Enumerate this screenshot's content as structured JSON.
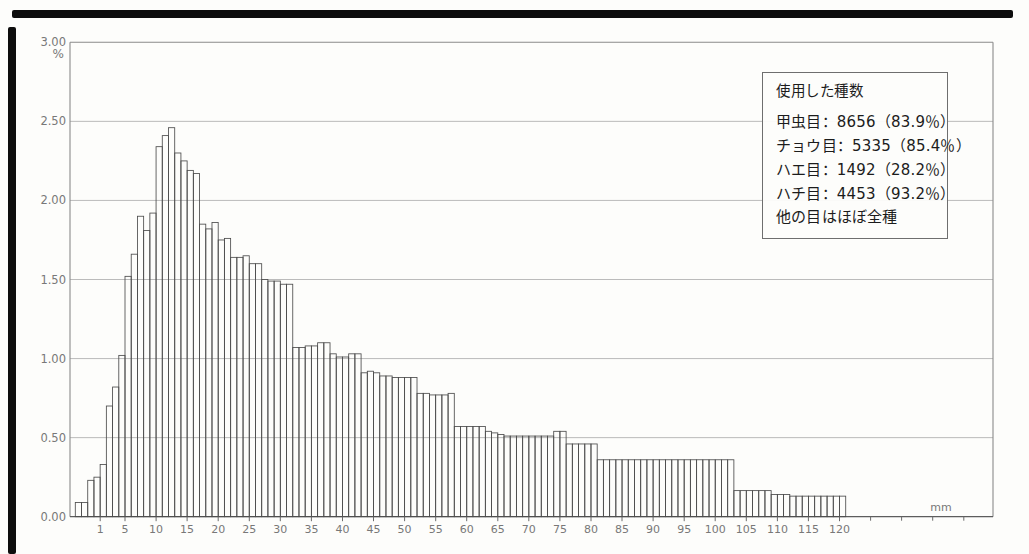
{
  "chart_data": {
    "type": "bar",
    "title": "",
    "xlabel": "mm",
    "ylabel": "%",
    "ylim": [
      0,
      3
    ],
    "grid": "horizontal",
    "y_tick_labels": [
      "3.00",
      "2.50",
      "2.00",
      "1.50",
      "1.00",
      "0.50",
      "0.00"
    ],
    "y_tick_values": [
      3.0,
      2.5,
      2.0,
      1.5,
      1.0,
      0.5,
      0.0
    ],
    "x_tick_labels": [
      1,
      5,
      10,
      15,
      20,
      25,
      30,
      35,
      40,
      45,
      50,
      55,
      60,
      65,
      70,
      75,
      80,
      85,
      90,
      95,
      100,
      105,
      110,
      115,
      120
    ],
    "x_unlabeled_ticks_mm": [
      125,
      130,
      135,
      140
    ],
    "bin_width_mm": 1,
    "bar_fill": "none",
    "bar_outline": "#4d4d4d",
    "values_pct": [
      0.09,
      0.09,
      0.23,
      0.25,
      0.33,
      0.7,
      0.82,
      1.02,
      1.52,
      1.66,
      1.9,
      1.81,
      1.92,
      2.34,
      2.41,
      2.46,
      2.3,
      2.25,
      2.19,
      2.17,
      1.85,
      1.82,
      1.86,
      1.75,
      1.76,
      1.64,
      1.64,
      1.65,
      1.6,
      1.6,
      1.5,
      1.49,
      1.49,
      1.47,
      1.47,
      1.07,
      1.07,
      1.08,
      1.08,
      1.1,
      1.1,
      1.03,
      1.01,
      1.01,
      1.03,
      1.03,
      0.91,
      0.92,
      0.91,
      0.89,
      0.89,
      0.88,
      0.88,
      0.88,
      0.88,
      0.78,
      0.78,
      0.77,
      0.77,
      0.77,
      0.78,
      0.57,
      0.57,
      0.57,
      0.57,
      0.57,
      0.54,
      0.53,
      0.52,
      0.51,
      0.51,
      0.51,
      0.51,
      0.51,
      0.51,
      0.51,
      0.51,
      0.54,
      0.54,
      0.46,
      0.46,
      0.46,
      0.46,
      0.46,
      0.36,
      0.36,
      0.36,
      0.36,
      0.36,
      0.36,
      0.36,
      0.36,
      0.36,
      0.36,
      0.36,
      0.36,
      0.36,
      0.36,
      0.36,
      0.36,
      0.36,
      0.36,
      0.36,
      0.36,
      0.36,
      0.36,
      0.165,
      0.165,
      0.165,
      0.165,
      0.165,
      0.165,
      0.14,
      0.14,
      0.14,
      0.13,
      0.13,
      0.13,
      0.13,
      0.13,
      0.13,
      0.13,
      0.13,
      0.13
    ],
    "colors": {
      "ink": "#4d4d4d",
      "grid": "#b3b3b3",
      "frame": "#8a8a8a",
      "axis_text": "#787878",
      "legend_text": "#1c1c1c"
    }
  },
  "legend": {
    "title": "使用した種数",
    "entries": [
      "甲虫目：8656（83.9％）",
      "チョウ目：5335（85.4％）",
      "ハエ目：1492（28.2％）",
      "ハチ目：4453（93.2％）",
      "他の目はほぼ全種"
    ]
  }
}
